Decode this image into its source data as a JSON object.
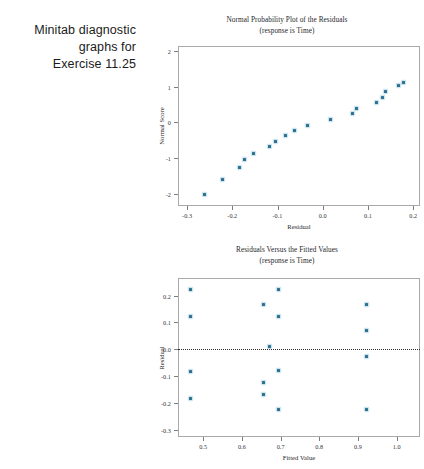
{
  "caption": {
    "line1": "Minitab diagnostic",
    "line2": "graphs for",
    "line3": "Exercise 11.25"
  },
  "chart_data": [
    {
      "type": "scatter",
      "title": "Normal Probability Plot of the Residuals",
      "subtitle": "(response is Time)",
      "xlabel": "Residual",
      "ylabel": "Normal Score",
      "xlim": [
        -0.32,
        0.215
      ],
      "ylim": [
        -2.35,
        2.15
      ],
      "xticks": [
        "-0.3",
        "-0.2",
        "-0.1",
        "0.0",
        "0.1",
        "0.2"
      ],
      "xtickvals": [
        -0.3,
        -0.2,
        -0.1,
        0.0,
        0.1,
        0.2
      ],
      "yticks": [
        "2",
        "1",
        "0",
        "-1",
        "-2"
      ],
      "ytickvals": [
        2,
        1,
        0,
        -1,
        -2
      ],
      "grid": false,
      "legend": "none",
      "x": [
        -0.262,
        -0.222,
        -0.183,
        -0.172,
        -0.152,
        -0.118,
        -0.104,
        -0.083,
        -0.062,
        -0.033,
        0.018,
        0.066,
        0.074,
        0.118,
        0.131,
        0.139,
        0.168,
        0.178
      ],
      "y": [
        -2.02,
        -1.61,
        -1.27,
        -1.05,
        -0.86,
        -0.69,
        -0.53,
        -0.38,
        -0.24,
        -0.09,
        0.09,
        0.25,
        0.4,
        0.56,
        0.71,
        0.86,
        1.05,
        1.12
      ]
    },
    {
      "type": "scatter",
      "title": "Residuals Versus the Fitted Values",
      "subtitle": "(response is Time)",
      "xlabel": "Fitted Value",
      "ylabel": "Residual",
      "xlim": [
        0.435,
        1.06
      ],
      "ylim": [
        -0.325,
        0.265
      ],
      "xticks": [
        "0.5",
        "0.6",
        "0.7",
        "0.8",
        "0.9",
        "1.0"
      ],
      "xtickvals": [
        0.5,
        0.6,
        0.7,
        0.8,
        0.9,
        1.0
      ],
      "yticks": [
        "0.2",
        "0.1",
        "0.0",
        "-0.1",
        "-0.2",
        "-0.3"
      ],
      "ytickvals": [
        0.2,
        0.1,
        0.0,
        -0.1,
        -0.2,
        -0.3
      ],
      "grid": false,
      "legend": "none",
      "reference_line": 0.0,
      "x": [
        0.468,
        0.468,
        0.468,
        0.468,
        0.655,
        0.655,
        0.655,
        0.672,
        0.695,
        0.695,
        0.695,
        0.695,
        0.923,
        0.923,
        0.923,
        0.923
      ],
      "y": [
        0.222,
        0.122,
        -0.082,
        -0.182,
        0.168,
        -0.122,
        -0.168,
        0.012,
        0.222,
        0.122,
        -0.078,
        -0.222,
        0.168,
        0.072,
        -0.028,
        -0.222
      ]
    }
  ]
}
